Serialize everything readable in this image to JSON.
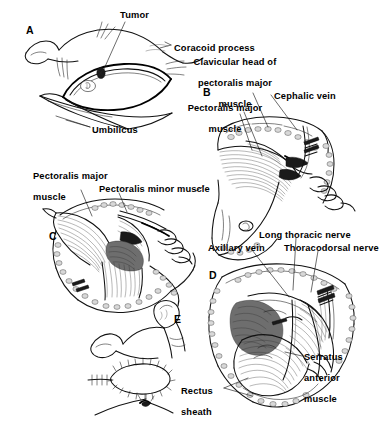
{
  "figure": {
    "background_color": "#ffffff",
    "ink_color": "#111111",
    "width": 390,
    "height": 423
  },
  "panels": [
    {
      "id": "A",
      "letter": "A",
      "name": "panel-a-incision-planning",
      "x": 26,
      "y": 24
    },
    {
      "id": "B",
      "letter": "B",
      "name": "panel-b-pectoralis-exposure",
      "x": 203,
      "y": 86
    },
    {
      "id": "C",
      "letter": "C",
      "name": "panel-c-pectoralis-minor-division",
      "x": 49,
      "y": 230
    },
    {
      "id": "D",
      "letter": "D",
      "name": "panel-d-axillary-dissection",
      "x": 209,
      "y": 269
    },
    {
      "id": "E",
      "letter": "E",
      "name": "panel-e-closure",
      "x": 174,
      "y": 313
    }
  ],
  "labels": [
    {
      "id": "tumor",
      "text": "Tumor",
      "lines": [
        "Tumor"
      ],
      "x": 120,
      "y": 10,
      "align": "left",
      "panel": "A"
    },
    {
      "id": "umbilicus",
      "text": "Umbilicus",
      "lines": [
        "Umbilicus"
      ],
      "x": 92,
      "y": 125,
      "align": "left",
      "panel": "A"
    },
    {
      "id": "coracoid-process",
      "text": "Coracoid process",
      "lines": [
        "Coracoid process"
      ],
      "x": 174,
      "y": 43,
      "align": "left",
      "panel": "B"
    },
    {
      "id": "clavicular-head",
      "text": "Clavicular head of pectoralis major muscle",
      "lines": [
        "Clavicular head of",
        "pectoralis major",
        "muscle"
      ],
      "x": 175,
      "y": 57,
      "align": "left",
      "panel": "B"
    },
    {
      "id": "cephalic-vein",
      "text": "Cephalic vein",
      "lines": [
        "Cephalic vein"
      ],
      "x": 274,
      "y": 91,
      "align": "left",
      "panel": "B"
    },
    {
      "id": "pectoralis-major-b",
      "text": "Pectoralis major muscle",
      "lines": [
        "Pectoralis major",
        "muscle"
      ],
      "x": 177,
      "y": 103,
      "align": "left",
      "panel": "B"
    },
    {
      "id": "pectoralis-major-c",
      "text": "Pectoralis major muscle",
      "lines": [
        "Pectoralis major",
        "muscle"
      ],
      "x": 33,
      "y": 171,
      "align": "left",
      "panel": "C"
    },
    {
      "id": "pectoralis-minor",
      "text": "Pectoralis minor muscle",
      "lines": [
        "Pectoralis minor muscle"
      ],
      "x": 99,
      "y": 184,
      "align": "left",
      "panel": "C"
    },
    {
      "id": "axillary-vein",
      "text": "Axillary vein",
      "lines": [
        "Axillary vein"
      ],
      "x": 208,
      "y": 243,
      "align": "left",
      "panel": "D"
    },
    {
      "id": "long-thoracic-nerve",
      "text": "Long thoracic nerve",
      "lines": [
        "Long thoracic nerve"
      ],
      "x": 259,
      "y": 230,
      "align": "left",
      "panel": "D"
    },
    {
      "id": "thoracodorsal-nerve",
      "text": "Thoracodorsal nerve",
      "lines": [
        "Thoracodorsal nerve"
      ],
      "x": 284,
      "y": 243,
      "align": "left",
      "panel": "D"
    },
    {
      "id": "serratus-anterior",
      "text": "Serratus anterior muscle",
      "lines": [
        "Serratus",
        "anterior",
        "muscle"
      ],
      "x": 304,
      "y": 352,
      "align": "left",
      "panel": "D"
    },
    {
      "id": "rectus-sheath",
      "text": "Rectus sheath",
      "lines": [
        "Rectus",
        "sheath"
      ],
      "x": 181,
      "y": 386,
      "align": "left",
      "panel": "D"
    }
  ]
}
